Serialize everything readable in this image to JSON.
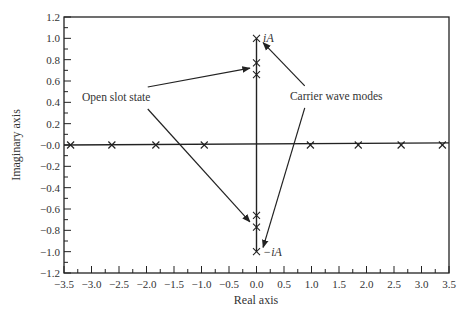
{
  "chart_data": {
    "type": "scatter",
    "title": "",
    "xlabel": "Real axis",
    "ylabel": "Imaginary axis",
    "xlim": [
      -3.5,
      3.5
    ],
    "ylim": [
      -1.2,
      1.2
    ],
    "grid": false,
    "xticks": [
      -3.5,
      -3.0,
      -2.5,
      -2.0,
      -1.5,
      -1.0,
      -0.5,
      0.0,
      0.5,
      1.0,
      1.5,
      2.0,
      2.5,
      3.0,
      3.5
    ],
    "xtick_labels": [
      "−3.5",
      "−3.0",
      "−2.5",
      "−2.0",
      "−1.5",
      "−1.0",
      "−0.5",
      "0.0",
      "0.5",
      "1.0",
      "1.5",
      "2.0",
      "2.5",
      "3.0",
      "3.5"
    ],
    "yticks": [
      1.2,
      1.0,
      0.8,
      0.6,
      0.4,
      0.2,
      0.0,
      -0.2,
      -0.4,
      -0.6,
      -0.8,
      -1.0,
      -1.2
    ],
    "ytick_labels": [
      "1.2",
      "1.0",
      "0.8",
      "0.6",
      "0.4",
      "0.2",
      "−0.0",
      "−0.2",
      "−0.4",
      "−0.6",
      "−0.8",
      "−1.0",
      "−1.2"
    ],
    "series": [
      {
        "name": "Real-axis modes",
        "marker": "x",
        "points": [
          [
            -3.38,
            0
          ],
          [
            -2.63,
            0
          ],
          [
            -1.83,
            0
          ],
          [
            -0.95,
            0
          ],
          [
            0.98,
            0
          ],
          [
            1.85,
            0
          ],
          [
            2.63,
            0
          ],
          [
            3.38,
            0
          ]
        ]
      },
      {
        "name": "Imaginary-axis modes",
        "marker": "x",
        "points": [
          [
            0,
            1.0
          ],
          [
            0,
            0.77
          ],
          [
            0,
            0.66
          ],
          [
            0,
            -0.66
          ],
          [
            0,
            -0.77
          ],
          [
            0,
            -1.0
          ]
        ]
      }
    ],
    "lines": [
      {
        "name": "real-axis-line",
        "from": [
          -3.5,
          0
        ],
        "to": [
          3.5,
          0.02
        ]
      },
      {
        "name": "imag-axis-line",
        "from": [
          0,
          -1.0
        ],
        "to": [
          0,
          1.0
        ]
      }
    ],
    "annotations": [
      {
        "text": "iA",
        "at": [
          0.12,
          1.0
        ]
      },
      {
        "text": "−iA",
        "at": [
          0.12,
          -1.0
        ]
      },
      {
        "text": "Open slot state",
        "at": [
          -2.55,
          0.45
        ],
        "arrows_to": [
          [
            -0.12,
            0.72
          ],
          [
            -0.12,
            -0.72
          ]
        ]
      },
      {
        "text": "Carrier wave modes",
        "at": [
          1.45,
          0.46
        ],
        "arrows_to": [
          [
            0.12,
            0.96
          ],
          [
            0.12,
            -0.96
          ]
        ]
      }
    ]
  }
}
